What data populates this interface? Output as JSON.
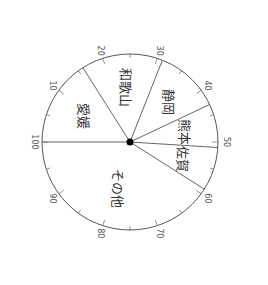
{
  "chart_data": {
    "type": "pie",
    "title": "",
    "orientation_note": "rotated 90deg clockwise; scale 0-100 starts at left and runs clockwise",
    "categories": [
      "愛媛",
      "和歌山",
      "静岡",
      "熊本",
      "佐賀",
      "その他"
    ],
    "values": [
      16,
      15,
      12,
      8,
      8,
      41
    ],
    "scale": {
      "min": 0,
      "max": 100,
      "major_ticks": [
        10,
        20,
        30,
        40,
        50,
        60,
        70,
        80,
        90,
        100
      ],
      "minor_step": 5,
      "tick_labels": [
        "10",
        "20",
        "30",
        "40",
        "50",
        "60",
        "70",
        "80",
        "90",
        "100"
      ]
    },
    "colors": {
      "outline": "#555555",
      "divider": "#666666",
      "center_dot": "#000000",
      "fill": "#ffffff"
    }
  }
}
